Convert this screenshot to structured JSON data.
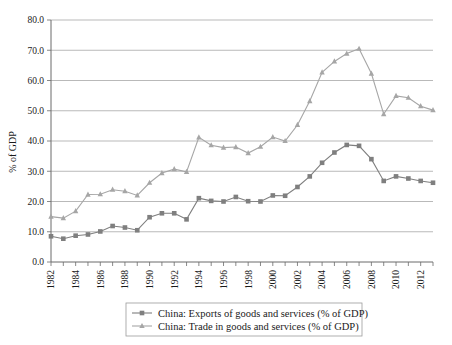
{
  "chart_data": {
    "type": "line",
    "title": "",
    "xlabel": "",
    "ylabel": "% of GDP",
    "ylim": [
      0,
      80
    ],
    "ytick_step": 10,
    "ytick_labels": [
      "0.0",
      "10.0",
      "20.0",
      "30.0",
      "40.0",
      "50.0",
      "60.0",
      "70.0",
      "80.0"
    ],
    "xlim": [
      1982,
      2013
    ],
    "xtick_labels": [
      "1982",
      "1984",
      "1986",
      "1988",
      "1990",
      "1992",
      "1994",
      "1996",
      "1998",
      "2000",
      "2002",
      "2004",
      "2006",
      "2008",
      "2010",
      "2012"
    ],
    "xtick_step": 2,
    "grid": "horizontal",
    "legend_position": "bottom",
    "x": [
      1982,
      1983,
      1984,
      1985,
      1986,
      1987,
      1988,
      1989,
      1990,
      1991,
      1992,
      1993,
      1994,
      1995,
      1996,
      1997,
      1998,
      1999,
      2000,
      2001,
      2002,
      2003,
      2004,
      2005,
      2006,
      2007,
      2008,
      2009,
      2010,
      2011,
      2012,
      2013
    ],
    "series": [
      {
        "name": "China: Exports of goods and services (% of GDP)",
        "marker": "square",
        "color": "#7f7f7f",
        "values": [
          8.5,
          7.7,
          8.7,
          9.1,
          10.1,
          11.9,
          11.4,
          10.5,
          14.8,
          16.1,
          16.1,
          14.1,
          21.1,
          20.2,
          20.0,
          21.5,
          20.1,
          20.0,
          22.0,
          21.9,
          24.8,
          28.3,
          32.8,
          36.2,
          38.7,
          38.4,
          34.0,
          26.8,
          28.3,
          27.6,
          26.8,
          26.2
        ]
      },
      {
        "name": "China: Trade in goods and services (% of GDP)",
        "marker": "triangle",
        "color": "#a6a6a6",
        "values": [
          15.0,
          14.5,
          16.8,
          22.3,
          22.4,
          23.9,
          23.4,
          22.0,
          26.2,
          29.4,
          30.7,
          29.8,
          41.2,
          38.6,
          37.8,
          38.0,
          36.0,
          38.1,
          41.3,
          40.0,
          45.3,
          53.2,
          62.7,
          66.3,
          68.9,
          70.5,
          62.3,
          48.9,
          54.9,
          54.3,
          51.5,
          50.2
        ]
      }
    ]
  },
  "legend": {
    "items": [
      {
        "label": "China: Exports of goods and services (% of GDP)"
      },
      {
        "label": "China: Trade in goods and services (% of GDP)"
      }
    ]
  },
  "axis": {
    "y_title": "% of GDP"
  }
}
